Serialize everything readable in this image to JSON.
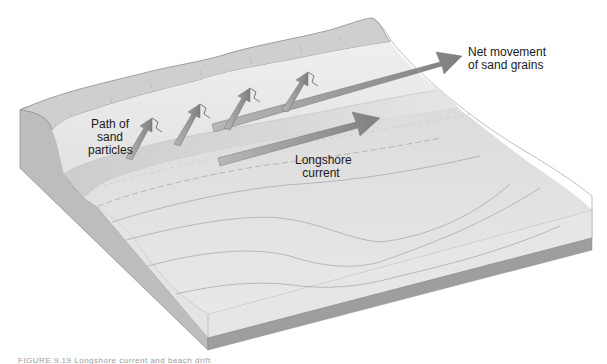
{
  "figure": {
    "type": "block-diagram",
    "labels": {
      "net_movement": [
        "Net movement",
        "of sand grains"
      ],
      "path_of_sand": [
        "Path of",
        "sand",
        "particles"
      ],
      "longshore_current": [
        "Longshore",
        "current"
      ]
    },
    "caption_truncated": "FIGURE 9.19  Longshore current and beach drift",
    "colors": {
      "background": "#ffffff",
      "block_side": "#bdbdbd",
      "block_front": "#e4e4e4",
      "base_strip": "#9e9e9e",
      "dune_ridge": "#cfcfcf",
      "beach": "#ececec",
      "water_surface": "#dedede",
      "arrow": "#8c8c8c",
      "text": "#1a1a1a"
    },
    "arrows": [
      {
        "name": "net-movement-arrow",
        "from": [
          212,
          128
        ],
        "to": [
          462,
          56
        ]
      },
      {
        "name": "longshore-current-arrow",
        "from": [
          218,
          162
        ],
        "to": [
          380,
          118
        ]
      },
      {
        "name": "swash-arrow-1",
        "from": [
          128,
          158
        ],
        "to": [
          152,
          120
        ]
      },
      {
        "name": "swash-arrow-2",
        "from": [
          176,
          144
        ],
        "to": [
          200,
          108
        ]
      },
      {
        "name": "swash-arrow-3",
        "from": [
          226,
          128
        ],
        "to": [
          250,
          92
        ]
      },
      {
        "name": "swash-arrow-4",
        "from": [
          285,
          112
        ],
        "to": [
          307,
          80
        ]
      }
    ]
  }
}
